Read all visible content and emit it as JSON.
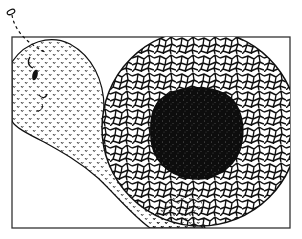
{
  "figure": {
    "colors": {
      "background": "#ffffff",
      "ink": "#111111",
      "frame": "#333333",
      "core": "#0d0d0d",
      "speckle": "#9a9a9a"
    },
    "frame": {
      "x": 12,
      "y": 37,
      "width": 278,
      "height": 191
    },
    "antenna": {
      "tip_x": 11,
      "tip_y": 12,
      "base_x": 45,
      "base_y": 52
    },
    "face": {
      "eye": {
        "cx": 35,
        "cy": 75,
        "rx": 3,
        "ry": 6
      },
      "brow": "arc",
      "mouth": "smile"
    },
    "cell_circle": {
      "cx": 200,
      "cy": 128,
      "r": 98
    },
    "core_blob": {
      "cx": 196,
      "cy": 132,
      "r": 45
    }
  }
}
